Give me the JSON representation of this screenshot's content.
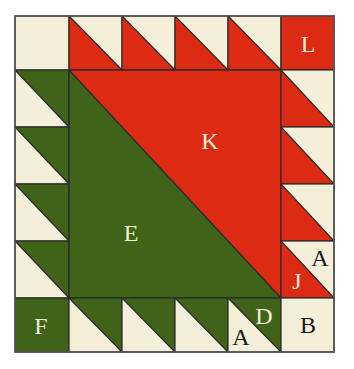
{
  "colors": {
    "cream": "#f3efd9",
    "red": "#dd2a12",
    "green": "#3f6317",
    "outline": "#2a2a2a",
    "label_light": "#f3efd9",
    "label_dark": "#1a1a1a"
  },
  "grid": {
    "cols": 6,
    "rows": 6
  },
  "pieces": {
    "corner_top_left": {
      "label": "",
      "color": "cream"
    },
    "corner_top_right": {
      "label": "L",
      "color": "red"
    },
    "corner_bottom_left": {
      "label": "F",
      "color": "green"
    },
    "corner_bottom_right": {
      "label": "B",
      "color": "cream"
    },
    "center_lower_left": {
      "label": "E",
      "color": "green"
    },
    "center_upper_right": {
      "label": "K",
      "color": "red"
    },
    "right_border_last_red": {
      "label": "J"
    },
    "right_border_last_cream": {
      "label": "A"
    },
    "bottom_border_last_green": {
      "label": "D"
    },
    "bottom_border_last_cream": {
      "label": "A"
    }
  },
  "borders": {
    "top": {
      "count": 4,
      "triangle_colors": [
        "red",
        "cream"
      ]
    },
    "left": {
      "count": 4,
      "triangle_colors": [
        "green",
        "cream"
      ]
    },
    "right": {
      "count": 4,
      "triangle_colors": [
        "red",
        "cream"
      ]
    },
    "bottom": {
      "count": 4,
      "triangle_colors": [
        "green",
        "cream"
      ]
    }
  }
}
